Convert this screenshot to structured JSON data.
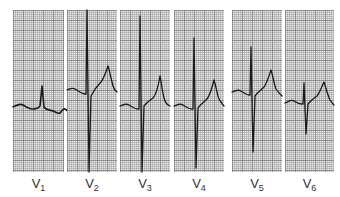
{
  "figure": {
    "title": ""
  },
  "colors": {
    "background": "#ffffff",
    "grid_paper": "#e6e6e6",
    "grid_lines": "#8c8c8c",
    "trace": "#1a1a1a",
    "label_text": "#333333"
  },
  "leads": [
    {
      "id": "V1",
      "letter": "V",
      "number": "1",
      "x": 13,
      "width": 51,
      "path": "M0,97 C4,95 7,93 10,95 C13,97 17,99 20,99 C22,99 24,98 25,98 L27,96 L29,76 L31,97 C33,100 37,100 40,101 C43,102 45,104 47,103 C49,101 50,98 52,99 C54,100 55,102 57,103",
      "qrs_polarity": "small r, deep S"
    },
    {
      "id": "V2",
      "letter": "V",
      "number": "2",
      "x": 67,
      "width": 50,
      "path": "M0,80 C3,79 5,77 8,79 C11,81 14,83 17,84 L19,84 L20,0 L22,162 L24,86 C27,80 30,76 34,72 C37,68 39,62 41,56 C42,58 43,65 45,72 C46,77 47,80 50,82",
      "qrs_polarity": "tall R, deep S"
    },
    {
      "id": "V3",
      "letter": "V",
      "number": "3",
      "x": 120,
      "width": 50,
      "path": "M0,96 C3,95 6,93 9,95 C12,97 15,99 18,99 L19,99 L20,6 L22,162 L24,96 C27,92 30,90 33,88 C36,85 38,78 40,66 C41,70 42,80 44,88 C45,92 47,95 50,96",
      "qrs_polarity": "tall R, deep S"
    },
    {
      "id": "V4",
      "letter": "V",
      "number": "4",
      "x": 174,
      "width": 50,
      "path": "M0,96 C3,95 6,93 9,95 C12,97 15,99 18,99 L19,99 L20,28 L22,158 L24,98 C27,94 30,92 33,89 C36,85 38,78 40,70 C42,76 43,84 45,89 C47,92 48,94 50,96",
      "qrs_polarity": "equiphasic, transition"
    },
    {
      "id": "V5",
      "letter": "V",
      "number": "5",
      "x": 232,
      "width": 50,
      "path": "M0,82 C3,81 6,79 9,81 C12,83 15,85 17,85 L18,85 L19,37 L21,142 L23,86 C26,82 29,80 32,77 C35,73 37,66 39,60 C41,66 42,74 44,79 C46,82 48,84 50,86",
      "qrs_polarity": "R slightly > S"
    },
    {
      "id": "V6",
      "letter": "V",
      "number": "6",
      "x": 285,
      "width": 49,
      "path": "M0,93 C3,92 6,89 9,91 C12,93 15,94 17,94 L18,94 L19,73 L21,124 L23,94 C26,90 29,88 32,86 C35,82 37,76 39,72 C41,78 43,86 45,90 C47,93 48,94 49,95",
      "qrs_polarity": "R with small S"
    }
  ]
}
